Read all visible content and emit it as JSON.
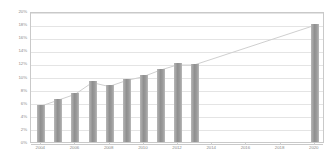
{
  "chart_data": {
    "type": "bar",
    "title": "",
    "subtitle": "",
    "xlabel": "",
    "ylabel": "",
    "grid": true,
    "legend": "none",
    "xlim": [
      2003.4,
      2020.6
    ],
    "ylim": [
      0,
      20
    ],
    "y_tick_labels": [
      "20%",
      "18%",
      "16%",
      "14%",
      "12%",
      "10%",
      "8%",
      "6%",
      "4%",
      "2%",
      "0%"
    ],
    "y_tick_values": [
      20,
      18,
      16,
      14,
      12,
      10,
      8,
      6,
      4,
      2,
      0
    ],
    "x_tick_labels": [
      "2004",
      "2006",
      "2008",
      "2010",
      "2012",
      "2014",
      "2016",
      "2018",
      "2020"
    ],
    "x_tick_values": [
      2004,
      2006,
      2008,
      2010,
      2012,
      2014,
      2016,
      2018,
      2020
    ],
    "categories": [
      2004,
      2005,
      2006,
      2007,
      2008,
      2009,
      2010,
      2011,
      2012,
      2013,
      2020
    ],
    "values": [
      5.7,
      6.6,
      7.5,
      9.3,
      8.7,
      9.6,
      10.2,
      11.2,
      12.0,
      11.9,
      18.0
    ],
    "series": [
      {
        "name": "bars",
        "values": [
          5.7,
          6.6,
          7.5,
          9.3,
          8.7,
          9.6,
          10.2,
          11.2,
          12.0,
          11.9,
          18.0
        ]
      },
      {
        "name": "trendline",
        "type": "line",
        "x": [
          2004,
          2005,
          2006,
          2007,
          2008,
          2009,
          2010,
          2011,
          2012,
          2013,
          2020
        ],
        "values": [
          5.7,
          6.6,
          7.5,
          9.3,
          8.7,
          9.6,
          10.2,
          11.2,
          12.0,
          12.0,
          18.0
        ]
      }
    ],
    "annotations": [],
    "colors": {
      "bar": "#9a9a9a",
      "bar_light": "#b8b8b8",
      "trendline": "#cfcfcf",
      "gridline": "#e4e4e4",
      "axis": "#c9c9c9",
      "tick_label": "#8a8a8a",
      "background": "#ffffff"
    }
  }
}
